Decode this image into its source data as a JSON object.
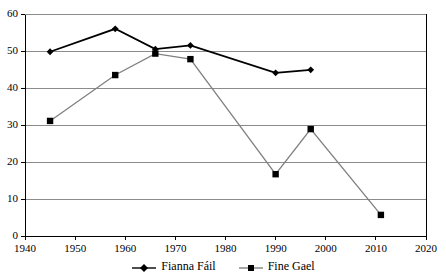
{
  "chart_data": {
    "type": "line",
    "title": "",
    "xlabel": "",
    "ylabel": "",
    "xlim": [
      1940,
      2020
    ],
    "ylim": [
      0,
      60
    ],
    "xticks": [
      1940,
      1950,
      1960,
      1970,
      1980,
      1990,
      2000,
      2010,
      2020
    ],
    "yticks": [
      0,
      10,
      20,
      30,
      40,
      50,
      60
    ],
    "grid": "horizontal",
    "legend_position": "bottom",
    "series": [
      {
        "name": "Fianna Fáil",
        "color": "#000000",
        "marker": "diamond",
        "x": [
          1945,
          1958,
          1966,
          1973,
          1990,
          1997
        ],
        "values": [
          49.8,
          56.0,
          50.5,
          51.5,
          44.1,
          44.9
        ]
      },
      {
        "name": "Fine Gael",
        "color": "#808080",
        "marker": "square",
        "x": [
          1945,
          1958,
          1966,
          1973,
          1990,
          1997,
          2011
        ],
        "values": [
          31.1,
          43.5,
          49.3,
          47.8,
          16.7,
          28.9,
          5.7
        ]
      }
    ]
  },
  "legend": {
    "entries": [
      {
        "label": "Fianna Fáil"
      },
      {
        "label": "Fine Gael"
      }
    ]
  },
  "axes": {
    "y_tick_labels": [
      "0",
      "10",
      "20",
      "30",
      "40",
      "50",
      "60"
    ],
    "x_tick_labels": [
      "1940",
      "1950",
      "1960",
      "1970",
      "1980",
      "1990",
      "2000",
      "2010",
      "2020"
    ]
  },
  "colors": {
    "series_primary": "#000000",
    "series_secondary": "#808080",
    "gridline": "#8c8c8c",
    "axis": "#000000",
    "background": "#ffffff"
  }
}
